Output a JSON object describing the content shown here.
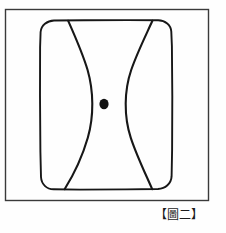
{
  "figure": {
    "caption_open_bracket": "【",
    "caption_label": "圖二",
    "caption_close_bracket": "】",
    "caption_full": "【圖二】",
    "colors": {
      "background": "#fefefe",
      "stroke": "#1b1b1b",
      "outer_frame_stroke": "#3a3a3a",
      "dot_fill": "#111111"
    },
    "elements": {
      "outer_frame_name": "outer-rectangle-border",
      "inner_shape_name": "rounded-rectangle",
      "left_curve_name": "left-hyperbolic-curve",
      "right_curve_name": "right-hyperbolic-curve",
      "center_dot_name": "center-point-dot"
    },
    "geometry": {
      "outer_frame": {
        "x": 5,
        "y": 9,
        "width": 204,
        "height": 192
      },
      "inner_rect": {
        "x": 40,
        "y": 20,
        "width": 132,
        "height": 170,
        "corner_radius": 14
      },
      "center_dot": {
        "cx": 104,
        "cy": 104,
        "rx": 4.5,
        "ry": 5
      },
      "left_curve": {
        "top_x": 68,
        "waist_x": 92,
        "bottom_x": 64
      },
      "right_curve": {
        "top_x": 152,
        "waist_x": 117,
        "bottom_x": 152
      }
    }
  }
}
